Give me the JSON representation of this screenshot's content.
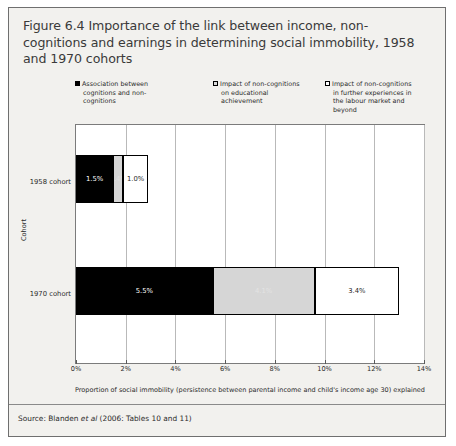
{
  "figure": {
    "title": "Figure 6.4 Importance of the link between income, non-cognitions and earnings in determining social immobility, 1958 and 1970 cohorts",
    "source_prefix": "Source: Blanden ",
    "source_italic": "et al",
    "source_suffix": " (2006: Tables 10 and 11)"
  },
  "chart_data": {
    "type": "bar",
    "orientation": "horizontal",
    "stacked": true,
    "title": "Figure 6.4 Importance of the link between income, non-cognitions and earnings in determining social immobility, 1958 and 1970 cohorts",
    "categories": [
      "1958 cohort",
      "1970 cohort"
    ],
    "series": [
      {
        "name": "Association between cognitions and non-cognitions",
        "values": [
          1.5,
          5.5
        ],
        "labels": [
          "1.5%",
          "5.5%"
        ],
        "color": "#000000"
      },
      {
        "name": "Impact of non-cognitions on educational achievement",
        "values": [
          0.4,
          4.1
        ],
        "labels": [
          "0.4%",
          "4.1%"
        ],
        "color": "#d6d6d6"
      },
      {
        "name": "Impact of non-cognitions in further experiences in the labour market and beyond",
        "values": [
          1.0,
          3.4
        ],
        "labels": [
          "1.0%",
          "3.4%"
        ],
        "color": "#ffffff"
      }
    ],
    "totals": [
      2.9,
      13.0
    ],
    "xlabel": "Proportion of social immobility (persistence between parental income and child's income age 30) explained",
    "ylabel": "Cohort",
    "xlim": [
      0,
      14
    ],
    "xticks": [
      "0%",
      "2%",
      "4%",
      "6%",
      "8%",
      "10%",
      "12%",
      "14%"
    ],
    "xtick_values": [
      0,
      2,
      4,
      6,
      8,
      10,
      12,
      14
    ],
    "grid": true,
    "legend_position": "top"
  },
  "legend": [
    {
      "swatch": "black",
      "line1": "Association between",
      "line2": "cognitions and non-",
      "line3": "cognitions",
      "line4": ""
    },
    {
      "swatch": "grey",
      "line1": "Impact of non-cognitions",
      "line2": "on educational",
      "line3": "achievement",
      "line4": ""
    },
    {
      "swatch": "white",
      "line1": "Impact of non-cognitions",
      "line2": "in further experiences in",
      "line3": "the labour market and",
      "line4": "beyond"
    }
  ]
}
